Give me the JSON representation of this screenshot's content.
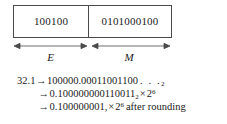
{
  "figure": {
    "bit_box": {
      "exponent": {
        "bits": "100100",
        "label": "E",
        "arrow_icon": "double-headed-arrow-icon"
      },
      "mantissa": {
        "bits": "0101000100",
        "label": "M",
        "arrow_icon": "double-headed-arrow-icon"
      }
    },
    "derivation": {
      "line1": {
        "value": "32.1",
        "arrow": "→",
        "expansion": "100000.00011001100",
        "ellipsis": ". . .",
        "radix_subscript": "2"
      },
      "line2": {
        "arrow": "→",
        "mantissa": "0.100000000110011",
        "radix_subscript": "2",
        "times": "×",
        "base": "2",
        "exponent_superscript": "6"
      },
      "line3": {
        "arrow": "→",
        "mantissa": "0.100000001,",
        "times": "×",
        "base": "2",
        "exponent_superscript": "6",
        "note": "after rounding"
      }
    },
    "colors": {
      "border": "#4a4a4a",
      "text": "#1a1a1a",
      "background": "#ffffff"
    }
  }
}
